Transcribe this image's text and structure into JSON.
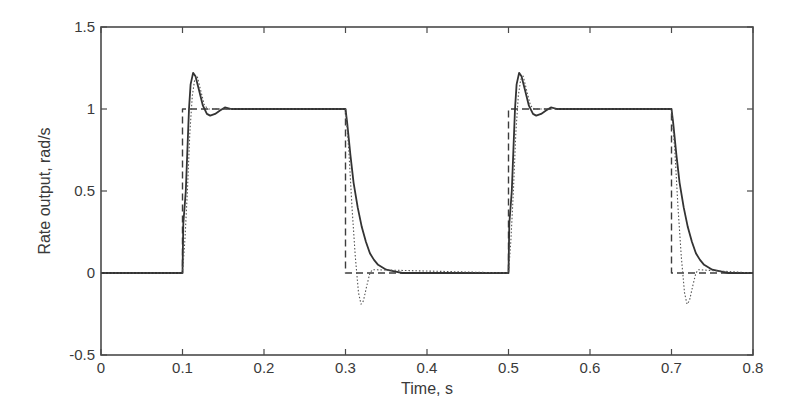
{
  "chart_data": {
    "type": "line",
    "title": "",
    "xlabel": "Time, s",
    "ylabel": "Rate output, rad/s",
    "xlim": [
      0,
      0.8
    ],
    "ylim": [
      -0.5,
      1.5
    ],
    "xticks": [
      "0",
      "0.1",
      "0.2",
      "0.3",
      "0.4",
      "0.5",
      "0.6",
      "0.7",
      "0.8"
    ],
    "yticks": [
      "-0.5",
      "0",
      "0.5",
      "1",
      "1.5"
    ],
    "grid": false,
    "legend": null,
    "series": [
      {
        "name": "command",
        "style": "dashed",
        "x": [
          0,
          0.1,
          0.1,
          0.3,
          0.3,
          0.5,
          0.5,
          0.7,
          0.7,
          0.8
        ],
        "y": [
          0,
          0,
          1,
          1,
          0,
          0,
          1,
          1,
          0,
          0
        ]
      },
      {
        "name": "response (solid)",
        "style": "solid",
        "x": [
          0,
          0.1,
          0.101,
          0.104,
          0.106,
          0.108,
          0.11,
          0.113,
          0.116,
          0.12,
          0.125,
          0.13,
          0.134,
          0.14,
          0.146,
          0.152,
          0.16,
          0.2,
          0.3,
          0.302,
          0.306,
          0.31,
          0.315,
          0.32,
          0.325,
          0.33,
          0.335,
          0.34,
          0.35,
          0.36,
          0.37,
          0.5,
          0.501,
          0.504,
          0.506,
          0.508,
          0.51,
          0.513,
          0.516,
          0.52,
          0.525,
          0.53,
          0.534,
          0.54,
          0.546,
          0.552,
          0.56,
          0.6,
          0.7,
          0.702,
          0.706,
          0.71,
          0.715,
          0.72,
          0.725,
          0.73,
          0.735,
          0.74,
          0.75,
          0.76,
          0.77,
          0.8
        ],
        "y": [
          0,
          0,
          0.3,
          0.5,
          0.75,
          1.0,
          1.15,
          1.22,
          1.2,
          1.12,
          1.02,
          0.97,
          0.96,
          0.97,
          0.99,
          1.01,
          1.0,
          1.0,
          1.0,
          0.92,
          0.72,
          0.55,
          0.4,
          0.28,
          0.19,
          0.12,
          0.08,
          0.05,
          0.02,
          0.01,
          0.0,
          0,
          0.3,
          0.5,
          0.75,
          1.0,
          1.15,
          1.22,
          1.2,
          1.12,
          1.02,
          0.97,
          0.96,
          0.97,
          0.99,
          1.01,
          1.0,
          1.0,
          1.0,
          0.92,
          0.72,
          0.55,
          0.4,
          0.28,
          0.19,
          0.12,
          0.08,
          0.05,
          0.02,
          0.01,
          0.0,
          0.0
        ]
      },
      {
        "name": "response (dotted)",
        "style": "dotted",
        "x": [
          0,
          0.1,
          0.103,
          0.106,
          0.109,
          0.112,
          0.115,
          0.118,
          0.122,
          0.127,
          0.132,
          0.3,
          0.304,
          0.308,
          0.312,
          0.316,
          0.319,
          0.322,
          0.326,
          0.33,
          0.333,
          0.5,
          0.503,
          0.506,
          0.509,
          0.512,
          0.515,
          0.518,
          0.522,
          0.527,
          0.532,
          0.7,
          0.704,
          0.708,
          0.712,
          0.716,
          0.719,
          0.722,
          0.726,
          0.73,
          0.733,
          0.8
        ],
        "y": [
          0,
          0,
          0.2,
          0.5,
          0.85,
          1.08,
          1.18,
          1.2,
          1.12,
          1.02,
          1.0,
          1.0,
          0.75,
          0.4,
          0.1,
          -0.12,
          -0.19,
          -0.17,
          -0.08,
          0.0,
          0.02,
          0,
          0.2,
          0.5,
          0.85,
          1.08,
          1.18,
          1.2,
          1.12,
          1.02,
          1.0,
          1.0,
          0.75,
          0.4,
          0.1,
          -0.12,
          -0.19,
          -0.17,
          -0.08,
          0.0,
          0.02,
          0.0
        ]
      }
    ]
  }
}
